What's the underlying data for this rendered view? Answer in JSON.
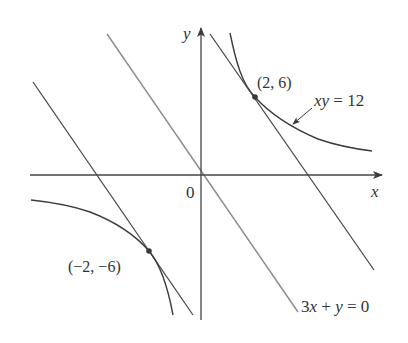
{
  "figure": {
    "type": "diagram",
    "colors": {
      "background": "#ffffff",
      "axes": "#444444",
      "curve": "#3d3d3d",
      "tangent_lines": "#4a4a4a",
      "reference_line": "#8c8c8c",
      "text": "#333333"
    }
  },
  "axes": {
    "x_label": "x",
    "y_label": "y",
    "origin_label": "0"
  },
  "curve": {
    "equation_label": "xy = 12",
    "equation_parts": {
      "lhs": "xy",
      "eq": " = ",
      "rhs": "12"
    }
  },
  "reference_line": {
    "equation_label": "3x + y = 0",
    "equation_parts": {
      "a": "3",
      "x": "x",
      "plus": " + ",
      "y": "y",
      "eq": " = ",
      "rhs": "0"
    }
  },
  "points": [
    {
      "label": "(2, 6)",
      "x": 2,
      "y": 6
    },
    {
      "label": "(−2, −6)",
      "x": -2,
      "y": -6
    }
  ],
  "tangent_lines": [
    {
      "name": "tangent-at-2-6",
      "equation": "y = -3x + 12"
    },
    {
      "name": "tangent-at-neg2-neg6",
      "equation": "y = -3x - 12"
    }
  ]
}
